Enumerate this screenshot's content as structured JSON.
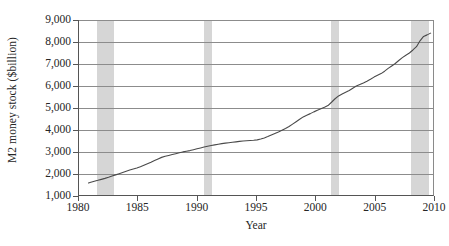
{
  "chart_data": {
    "type": "line",
    "title": "",
    "xlabel": "Year",
    "ylabel": "M2 money stock ($billion)",
    "xlim": [
      1980,
      2010
    ],
    "ylim": [
      1000,
      9000
    ],
    "grid": "horizontal",
    "legend": "none",
    "xticks": [
      1980,
      1985,
      1990,
      1995,
      2000,
      2005,
      2010
    ],
    "xtick_labels": [
      "1980",
      "1985",
      "1990",
      "1995",
      "2000",
      "2005",
      "2010"
    ],
    "yticks": [
      1000,
      2000,
      3000,
      4000,
      5000,
      6000,
      7000,
      8000,
      9000
    ],
    "ytick_labels": [
      "1,000",
      "2,000",
      "3,000",
      "4,000",
      "5,000",
      "6,000",
      "7,000",
      "8,000",
      "9,000"
    ],
    "line_color": "#4a4a4a",
    "band_color": "#d6d6d6",
    "shaded_regions": [
      {
        "label": "recession",
        "start": 1981.5,
        "end": 1982.92
      },
      {
        "label": "recession",
        "start": 1990.54,
        "end": 1991.21
      },
      {
        "label": "recession",
        "start": 2001.21,
        "end": 2001.88
      },
      {
        "label": "recession",
        "start": 2007.96,
        "end": 2009.46
      }
    ],
    "series": [
      {
        "name": "M2 money stock",
        "x": [
          1980.8,
          1981.0,
          1981.3,
          1981.6,
          1981.9,
          1982.2,
          1982.5,
          1982.8,
          1983.1,
          1983.4,
          1983.7,
          1984.0,
          1984.3,
          1984.6,
          1984.9,
          1985.2,
          1985.5,
          1985.8,
          1986.1,
          1986.4,
          1986.7,
          1987.0,
          1987.3,
          1987.6,
          1987.9,
          1988.2,
          1988.5,
          1988.8,
          1989.1,
          1989.4,
          1989.7,
          1990.0,
          1990.3,
          1990.6,
          1990.9,
          1991.2,
          1991.5,
          1991.8,
          1992.1,
          1992.4,
          1992.7,
          1993.0,
          1993.3,
          1993.6,
          1993.9,
          1994.2,
          1994.5,
          1994.8,
          1995.1,
          1995.4,
          1995.7,
          1996.0,
          1996.3,
          1996.6,
          1996.9,
          1997.2,
          1997.5,
          1997.8,
          1998.1,
          1998.4,
          1998.7,
          1999.0,
          1999.3,
          1999.6,
          1999.9,
          2000.2,
          2000.5,
          2000.8,
          2001.1,
          2001.4,
          2001.7,
          2002.0,
          2002.3,
          2002.6,
          2002.9,
          2003.2,
          2003.5,
          2003.8,
          2004.1,
          2004.4,
          2004.7,
          2005.0,
          2005.3,
          2005.6,
          2005.9,
          2006.2,
          2006.5,
          2006.8,
          2007.1,
          2007.4,
          2007.7,
          2008.0,
          2008.3,
          2008.6,
          2008.9,
          2009.2,
          2009.5,
          2009.8
        ],
        "y": [
          1550,
          1585,
          1630,
          1670,
          1715,
          1760,
          1810,
          1865,
          1920,
          1975,
          2030,
          2085,
          2140,
          2185,
          2230,
          2290,
          2360,
          2430,
          2500,
          2575,
          2650,
          2720,
          2770,
          2810,
          2850,
          2890,
          2930,
          2970,
          3000,
          3030,
          3070,
          3110,
          3150,
          3190,
          3230,
          3260,
          3290,
          3320,
          3350,
          3370,
          3390,
          3410,
          3430,
          3450,
          3470,
          3480,
          3490,
          3500,
          3520,
          3560,
          3610,
          3670,
          3740,
          3810,
          3880,
          3960,
          4040,
          4130,
          4240,
          4350,
          4460,
          4570,
          4650,
          4720,
          4800,
          4870,
          4940,
          5010,
          5090,
          5240,
          5400,
          5530,
          5620,
          5700,
          5780,
          5880,
          5980,
          6050,
          6120,
          6200,
          6290,
          6390,
          6470,
          6550,
          6660,
          6790,
          6900,
          7010,
          7150,
          7280,
          7390,
          7490,
          7630,
          7780,
          8050,
          8250,
          8320,
          8400
        ]
      }
    ]
  }
}
